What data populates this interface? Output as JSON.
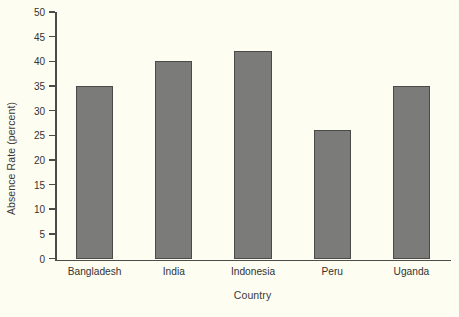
{
  "chart_data": {
    "type": "bar",
    "title": "",
    "xlabel": "Country",
    "ylabel": "Absence Rate (percent)",
    "categories": [
      "Bangladesh",
      "India",
      "Indonesia",
      "Peru",
      "Uganda"
    ],
    "values": [
      35,
      40,
      42,
      26,
      35
    ],
    "ylim": [
      0,
      50
    ],
    "ytick_labels": [
      "0",
      "5",
      "10",
      "15",
      "20",
      "25",
      "30",
      "35",
      "40",
      "45",
      "50"
    ],
    "ytick_values": [
      0,
      5,
      10,
      15,
      20,
      25,
      30,
      35,
      40,
      45,
      50
    ],
    "grid": false,
    "legend": null,
    "colors": {
      "bar_fill": "#7b7b79",
      "bar_edge": "#4a4a48",
      "axis": "#4c4c4a",
      "background": "#fdfdf2",
      "text": "#333331"
    }
  }
}
